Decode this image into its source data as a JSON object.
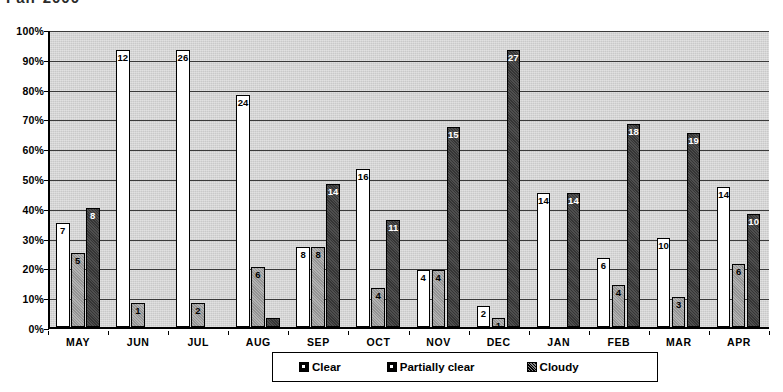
{
  "title": "Fair 2000",
  "chart_data": {
    "type": "bar",
    "title": "Fair 2000",
    "xlabel": "",
    "ylabel": "",
    "ylim": [
      0,
      100
    ],
    "ytick_labels": [
      "0%",
      "10%",
      "20%",
      "30%",
      "40%",
      "50%",
      "60%",
      "70%",
      "80%",
      "90%",
      "100%"
    ],
    "ytick_values": [
      0,
      10,
      20,
      30,
      40,
      50,
      60,
      70,
      80,
      90,
      100
    ],
    "grid": true,
    "legend_position": "bottom-center",
    "categories": [
      "MAY",
      "JUN",
      "JUL",
      "AUG",
      "SEP",
      "OCT",
      "NOV",
      "DEC",
      "JAN",
      "FEB",
      "MAR",
      "APR"
    ],
    "series": [
      {
        "name": "Clear",
        "color": "#ffffff",
        "values": [
          7,
          12,
          26,
          24,
          8,
          16,
          4,
          2,
          14,
          6,
          10,
          14
        ],
        "percents": [
          35,
          93,
          93,
          78,
          27,
          53,
          19,
          7,
          45,
          23,
          30,
          47
        ],
        "labels": [
          "7",
          "12",
          "26",
          "24",
          "8",
          "16",
          "4",
          "2",
          "14",
          "6",
          "10",
          "14"
        ]
      },
      {
        "name": "Partially clear",
        "color": "#a8a8a8",
        "values": [
          5,
          1,
          2,
          6,
          8,
          4,
          4,
          1,
          0,
          4,
          3,
          6
        ],
        "percents": [
          25,
          8,
          8,
          20,
          27,
          13,
          19,
          3,
          0,
          14,
          10,
          21
        ],
        "labels": [
          "5",
          "1",
          "2",
          "6",
          "8",
          "4",
          "4",
          "1",
          "",
          "4",
          "3",
          "6"
        ]
      },
      {
        "name": "Cloudy",
        "color": "#3b3b3b",
        "values": [
          8,
          0,
          0,
          1,
          14,
          11,
          15,
          27,
          14,
          18,
          19,
          10
        ],
        "percents": [
          40,
          0,
          0,
          3,
          48,
          36,
          67,
          93,
          45,
          68,
          65,
          38
        ],
        "labels": [
          "8",
          "",
          "",
          "",
          "14",
          "11",
          "15",
          "27",
          "14",
          "18",
          "19",
          "10"
        ]
      }
    ]
  },
  "legend": {
    "items": [
      {
        "label": "Clear",
        "swatch": "clear"
      },
      {
        "label": "Partially clear",
        "swatch": "partial"
      },
      {
        "label": "Cloudy",
        "swatch": "cloudy"
      }
    ]
  }
}
